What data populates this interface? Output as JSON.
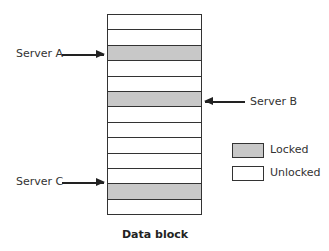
{
  "diagram": {
    "caption": "Data block",
    "row_count": 13,
    "rows": [
      {
        "index": 1,
        "state": "unlocked"
      },
      {
        "index": 2,
        "state": "unlocked"
      },
      {
        "index": 3,
        "state": "locked",
        "holder": "Server A"
      },
      {
        "index": 4,
        "state": "unlocked"
      },
      {
        "index": 5,
        "state": "unlocked"
      },
      {
        "index": 6,
        "state": "locked",
        "holder": "Server B"
      },
      {
        "index": 7,
        "state": "unlocked"
      },
      {
        "index": 8,
        "state": "unlocked"
      },
      {
        "index": 9,
        "state": "unlocked"
      },
      {
        "index": 10,
        "state": "unlocked"
      },
      {
        "index": 11,
        "state": "unlocked"
      },
      {
        "index": 12,
        "state": "locked",
        "holder": "Server C"
      },
      {
        "index": 13,
        "state": "unlocked"
      }
    ],
    "servers": [
      {
        "label": "Server A",
        "side": "left",
        "row": 3
      },
      {
        "label": "Server B",
        "side": "right",
        "row": 6
      },
      {
        "label": "Server C",
        "side": "left",
        "row": 12
      }
    ],
    "legend": [
      {
        "label": "Locked",
        "style": "hatched-gray"
      },
      {
        "label": "Unlocked",
        "style": "white"
      }
    ],
    "colors": {
      "locked_fill": "#c8c8c8",
      "stroke": "#333333",
      "unlocked_fill": "#ffffff"
    }
  }
}
